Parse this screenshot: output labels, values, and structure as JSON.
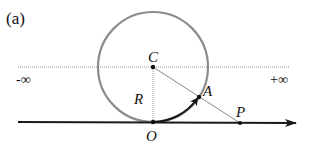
{
  "figure": {
    "panel_label": "(a)",
    "labels": {
      "center": "C",
      "origin": "O",
      "radius": "R",
      "circle_point": "A",
      "line_point": "P",
      "neg_infinity": "-∞",
      "pos_infinity": "+∞"
    },
    "colors": {
      "circle": "#8c8c8c",
      "axis": "#1a1a1a",
      "guide": "#666666",
      "point": "#111111"
    },
    "geometry": {
      "center": [
        153,
        67
      ],
      "radius": 55,
      "origin": [
        153,
        122
      ],
      "point_A": [
        199,
        97
      ],
      "point_P": [
        240,
        123
      ]
    }
  }
}
